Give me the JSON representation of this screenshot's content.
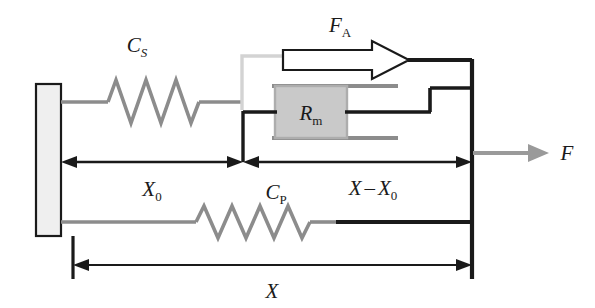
{
  "figure": {
    "type": "mechanical-schematic"
  },
  "colors": {
    "dark": "#1a1a1a",
    "gray_line": "#8c8c8c",
    "gray_fill": "#c9c9c9",
    "wall_fill": "#efefef",
    "white": "#ffffff",
    "background": "#ffffff"
  },
  "labels": {
    "series_spring": {
      "symbol": "C",
      "subscript": "S",
      "full": "CS"
    },
    "parallel_spring": {
      "symbol": "C",
      "subscript": "P",
      "full": "CP"
    },
    "damper": {
      "symbol": "R",
      "subscript": "m",
      "full": "Rm"
    },
    "active_force": {
      "symbol": "F",
      "subscript": "A",
      "full": "FA"
    },
    "external_force": {
      "symbol": "F",
      "subscript": "",
      "full": "F"
    },
    "dim_x0": {
      "symbol": "X",
      "subscript": "0",
      "full": "X0"
    },
    "dim_x_minus_x0": {
      "symbol": "X",
      "operator": "–",
      "symbol2": "X",
      "subscript2": "0",
      "full": "X – X0"
    },
    "dim_x": {
      "symbol": "X",
      "subscript": "",
      "full": "X"
    }
  },
  "elements": {
    "wall": {
      "name": "fixed-wall",
      "x": 36,
      "y": 84,
      "width": 25,
      "height": 152
    },
    "series_spring": {
      "name": "series-elastic-element",
      "coils": 4
    },
    "parallel_spring": {
      "name": "parallel-elastic-element",
      "coils": 5
    },
    "damper_piston": {
      "name": "damper-piston",
      "x": 275,
      "y": 86,
      "width": 72,
      "height": 52
    },
    "active_force_arrow": {
      "name": "active-force-block-arrow",
      "direction": "right"
    },
    "external_force_arrow": {
      "name": "external-force-arrow",
      "direction": "right"
    }
  },
  "dimensions": [
    {
      "name": "x0-dimension",
      "label": "X0",
      "from_x": 61,
      "to_x": 243,
      "y": 162
    },
    {
      "name": "x-minus-x0-dimension",
      "label": "X - X0",
      "from_x": 243,
      "to_x": 472,
      "y": 162
    },
    {
      "name": "x-dimension",
      "label": "X",
      "from_x": 73,
      "to_x": 472,
      "y": 265
    }
  ]
}
